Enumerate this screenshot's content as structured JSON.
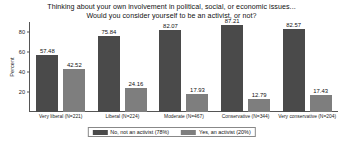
{
  "chart_data": {
    "type": "bar",
    "title": "Thinking about your own involvement in political, social, or economic issues... Would you consider yourself to be an activist, or not?",
    "title_lines": [
      "Thinking about your own involvement in political, social, or economic issues...",
      "Would you consider yourself to be an activist, or not?"
    ],
    "xlabel": "",
    "ylabel": "Percent",
    "ylim": [
      0,
      90
    ],
    "yticks": [
      20,
      40,
      60,
      80
    ],
    "grid": false,
    "legend_position": "bottom",
    "categories": [
      "Very liberal (N=221)",
      "Liberal (N=224)",
      "Moderate (N=467)",
      "Conservative (N=344)",
      "Very conservative (N=204)"
    ],
    "series": [
      {
        "name": "No, not an activist (78%)",
        "color": "#4a4a4a",
        "values": [
          57.48,
          75.84,
          82.07,
          87.21,
          82.57
        ]
      },
      {
        "name": "Yes, an activist (20%)",
        "color": "#7e7e7e",
        "values": [
          42.52,
          24.16,
          17.93,
          12.79,
          17.43
        ]
      }
    ]
  }
}
